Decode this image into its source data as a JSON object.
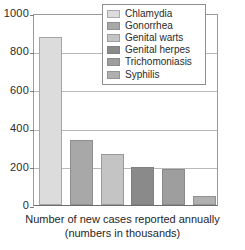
{
  "chart_data": {
    "type": "bar",
    "title": "",
    "subtitle": "",
    "xlabel": "Number of new cases reported annually (numbers in thousands)",
    "ylabel": "",
    "categories": [
      "Chlamydia",
      "Gonorrhea",
      "Genital warts",
      "Genital herpes",
      "Trichomoniasis",
      "Syphilis"
    ],
    "values": [
      875,
      340,
      265,
      200,
      185,
      45
    ],
    "ylim": [
      0,
      1000
    ],
    "yticks": [
      0,
      200,
      400,
      600,
      800,
      1000
    ],
    "ytick_labels": [
      "0",
      "200",
      "400",
      "600",
      "800",
      "1000"
    ],
    "grid": true,
    "legend_position": "top-right",
    "colors": [
      "#dcdcdc",
      "#a8a8a8",
      "#c4c4c4",
      "#8a8a8a",
      "#9e9e9e",
      "#b0b0b0"
    ],
    "series": [
      {
        "name": "Number of new cases reported annually (thousands)",
        "values": [
          875,
          340,
          265,
          200,
          185,
          45
        ]
      }
    ]
  },
  "legend": {
    "items": [
      {
        "label": "Chlamydia",
        "color": "#dcdcdc"
      },
      {
        "label": "Gonorrhea",
        "color": "#a8a8a8"
      },
      {
        "label": "Genital warts",
        "color": "#c4c4c4"
      },
      {
        "label": "Genital herpes",
        "color": "#8a8a8a"
      },
      {
        "label": "Trichomoniasis",
        "color": "#9e9e9e"
      },
      {
        "label": "Syphilis",
        "color": "#b0b0b0"
      }
    ]
  },
  "caption": {
    "line1": "Number of new cases reported annually",
    "line2": "(numbers in thousands)"
  }
}
